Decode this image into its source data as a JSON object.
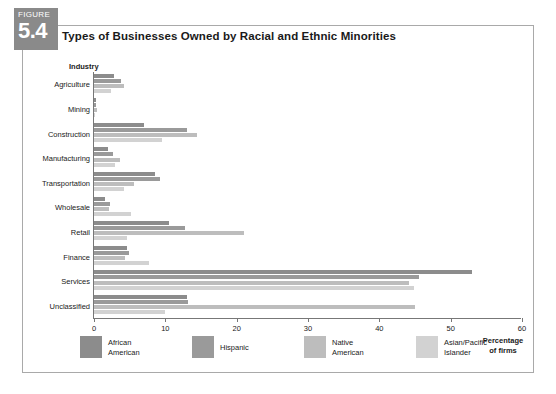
{
  "figure": {
    "badge_word": "FIGURE",
    "badge_number": "5.4",
    "title": "Types of Businesses Owned by Racial and Ethnic Minorities"
  },
  "chart_data": {
    "type": "bar",
    "orientation": "horizontal",
    "title": "Types of Businesses Owned by Racial and Ethnic Minorities",
    "xlabel": "Percentage of firms",
    "ylabel": "Industry",
    "xlim": [
      0,
      60
    ],
    "xticks": [
      0,
      10,
      20,
      30,
      40,
      50,
      60
    ],
    "grid": false,
    "legend_position": "bottom",
    "categories": [
      "Agriculture",
      "Mining",
      "Construction",
      "Manufacturing",
      "Transportation",
      "Wholesale",
      "Retail",
      "Finance",
      "Services",
      "Unclassified"
    ],
    "series": [
      {
        "name": "African American",
        "color": "#8c8c8c",
        "values": [
          2.8,
          0.3,
          7.0,
          1.9,
          8.5,
          1.6,
          10.5,
          4.6,
          53.0,
          13.0
        ]
      },
      {
        "name": "Hispanic",
        "color": "#9a9a9a",
        "values": [
          3.8,
          0.3,
          13.0,
          2.6,
          9.2,
          2.3,
          12.8,
          4.9,
          45.6,
          13.2
        ]
      },
      {
        "name": "Native American",
        "color": "#bdbdbd",
        "values": [
          4.2,
          0.4,
          14.5,
          3.6,
          5.6,
          2.1,
          21.0,
          4.3,
          44.2,
          45.0
        ]
      },
      {
        "name": "Asian/Pacific Islander",
        "color": "#d2d2d2",
        "values": [
          2.4,
          0.2,
          9.6,
          3.0,
          4.2,
          5.2,
          4.6,
          7.7,
          44.8,
          10.0
        ]
      }
    ]
  },
  "legend": {
    "items": [
      {
        "line1": "African",
        "line2": "American"
      },
      {
        "line1": "Hispanic",
        "line2": ""
      },
      {
        "line1": "Native",
        "line2": "American"
      },
      {
        "line1": "Asian/Pacific",
        "line2": "Islander"
      }
    ]
  },
  "axis": {
    "x_caption_line1": "Percentage",
    "x_caption_line2": "of firms"
  }
}
